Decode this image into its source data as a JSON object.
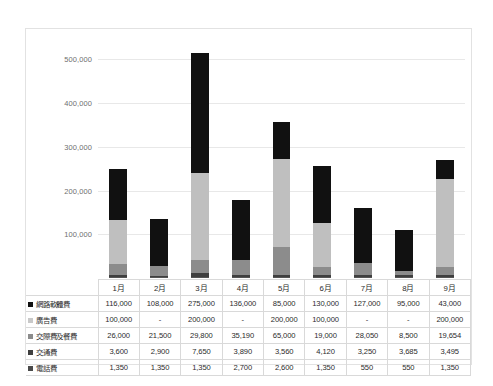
{
  "chart_data": {
    "type": "bar",
    "subtype": "stacked-column",
    "title": "",
    "xlabel": "",
    "ylabel": "",
    "categories": [
      "1月",
      "2月",
      "3月",
      "4月",
      "5月",
      "6月",
      "7月",
      "8月",
      "9月"
    ],
    "ylim": [
      0,
      560000
    ],
    "ytick_labels": [
      "100,000",
      "200,000",
      "300,000",
      "400,000",
      "500,000"
    ],
    "ytick_values": [
      100000,
      200000,
      300000,
      400000,
      500000
    ],
    "grid": true,
    "legend_position": "table-left",
    "stack_order_bottom_to_top": [
      "電話費",
      "交通費",
      "交際費及餐費",
      "廣告費",
      "網路軟體費"
    ],
    "series": [
      {
        "name": "網路軟體費",
        "color": "#111111",
        "values": [
          116000,
          108000,
          275000,
          136000,
          85000,
          130000,
          127000,
          95000,
          43000
        ],
        "display": [
          "116,000",
          "108,000",
          "275,000",
          "136,000",
          "85,000",
          "130,000",
          "127,000",
          "95,000",
          "43,000"
        ]
      },
      {
        "name": "廣告費",
        "color": "#bfbfbf",
        "values": [
          100000,
          0,
          200000,
          0,
          200000,
          100000,
          0,
          0,
          200000
        ],
        "display": [
          "100,000",
          "-",
          "200,000",
          "-",
          "200,000",
          "100,000",
          "-",
          "-",
          "200,000"
        ]
      },
      {
        "name": "交際費及餐費",
        "color": "#8c8c8c",
        "values": [
          26000,
          21500,
          29800,
          35190,
          65000,
          19000,
          28050,
          8500,
          19654
        ],
        "display": [
          "26,000",
          "21,500",
          "29,800",
          "35,190",
          "65,000",
          "19,000",
          "28,050",
          "8,500",
          "19,654"
        ]
      },
      {
        "name": "交通費",
        "color": "#3f3f3f",
        "values": [
          3600,
          2900,
          7650,
          3890,
          3560,
          4120,
          3250,
          3685,
          3495
        ],
        "display": [
          "3,600",
          "2,900",
          "7,650",
          "3,890",
          "3,560",
          "4,120",
          "3,250",
          "3,685",
          "3,495"
        ]
      },
      {
        "name": "電話費",
        "color": "#555555",
        "values": [
          1350,
          1350,
          1350,
          2700,
          2600,
          1350,
          550,
          550,
          1350
        ],
        "display": [
          "1,350",
          "1,350",
          "1,350",
          "2,700",
          "2,600",
          "1,350",
          "550",
          "550",
          "1,350"
        ]
      }
    ],
    "totals": [
      246950,
      133750,
      513800,
      177780,
      356160,
      254470,
      158850,
      107735,
      267499
    ]
  },
  "table": {
    "corner_label": "",
    "column_headers": [
      "1月",
      "2月",
      "3月",
      "4月",
      "5月",
      "6月",
      "7月",
      "8月",
      "9月"
    ],
    "rows": [
      {
        "label": "網路軟體費",
        "swatch": "#111111",
        "cells": [
          "116,000",
          "108,000",
          "275,000",
          "136,000",
          "85,000",
          "130,000",
          "127,000",
          "95,000",
          "43,000"
        ]
      },
      {
        "label": "廣告費",
        "swatch": "#c9c9c9",
        "cells": [
          "100,000",
          "-",
          "200,000",
          "-",
          "200,000",
          "100,000",
          "-",
          "-",
          "200,000"
        ]
      },
      {
        "label": "交際費及餐費",
        "swatch": "#8c8c8c",
        "cells": [
          "26,000",
          "21,500",
          "29,800",
          "35,190",
          "65,000",
          "19,000",
          "28,050",
          "8,500",
          "19,654"
        ]
      },
      {
        "label": "交通費",
        "swatch": "#3f3f3f",
        "cells": [
          "3,600",
          "2,900",
          "7,650",
          "3,890",
          "3,560",
          "4,120",
          "3,250",
          "3,685",
          "3,495"
        ]
      },
      {
        "label": "電話費",
        "swatch": "#4a4a4a",
        "cells": [
          "1,350",
          "1,350",
          "1,350",
          "2,700",
          "2,600",
          "1,350",
          "550",
          "550",
          "1,350"
        ]
      }
    ]
  }
}
